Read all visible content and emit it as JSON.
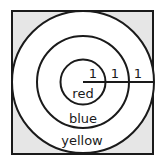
{
  "diagram": {
    "type": "concentric-circles-target",
    "colors": {
      "square_fill": "#e6e6e6",
      "circle_fill": "#ffffff",
      "stroke": "#1a1a1a"
    },
    "rings": [
      {
        "label": "red",
        "radius_units": 1
      },
      {
        "label": "blue",
        "radius_units": 2
      },
      {
        "label": "yellow",
        "radius_units": 3
      }
    ],
    "radius_segment_labels": [
      "1",
      "1",
      "1"
    ]
  }
}
